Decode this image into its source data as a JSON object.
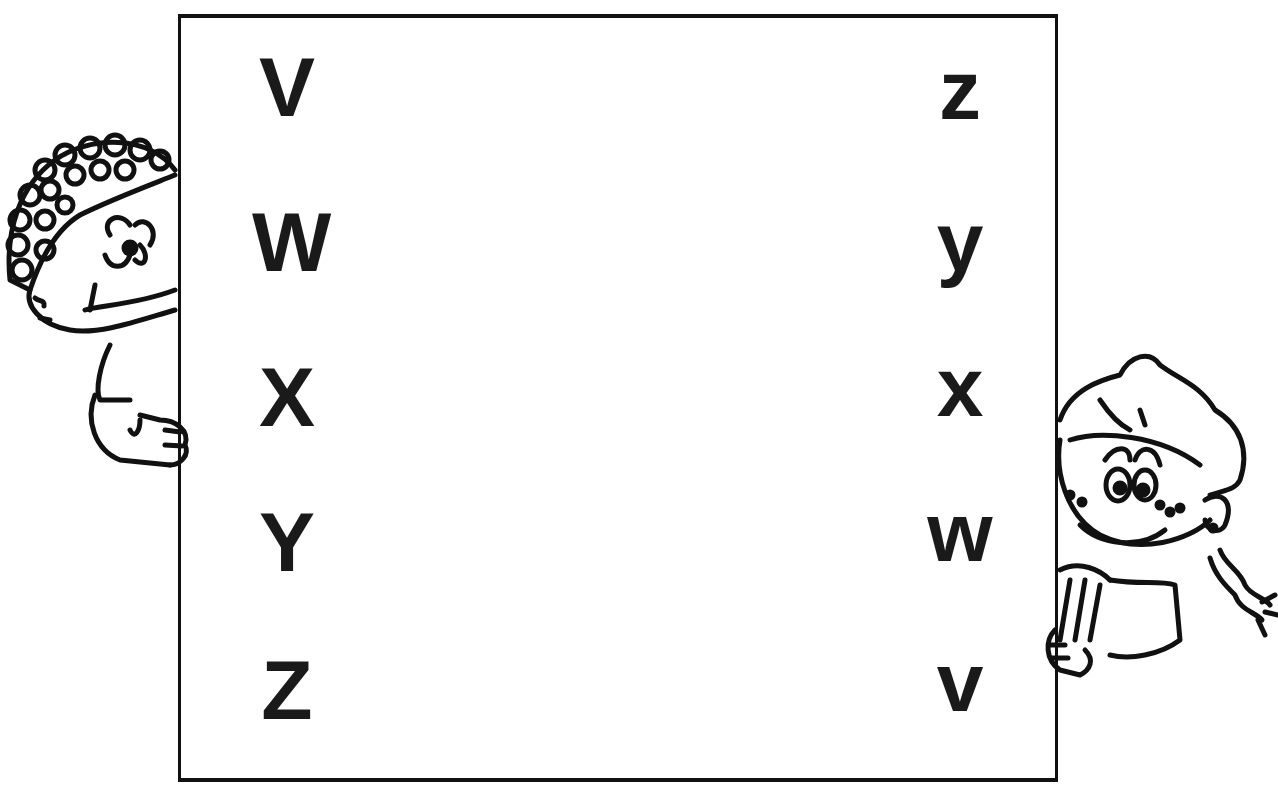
{
  "worksheet": {
    "task": "letter-matching",
    "left_column": {
      "case": "uppercase",
      "letters": [
        "V",
        "W",
        "X",
        "Y",
        "Z"
      ]
    },
    "right_column": {
      "case": "lowercase",
      "letters": [
        "z",
        "y",
        "x",
        "w",
        "v"
      ]
    },
    "figures": {
      "left": "boy-peeking",
      "right": "girl-peeking"
    },
    "colors": {
      "ink": "#111111",
      "paper": "#ffffff"
    }
  }
}
